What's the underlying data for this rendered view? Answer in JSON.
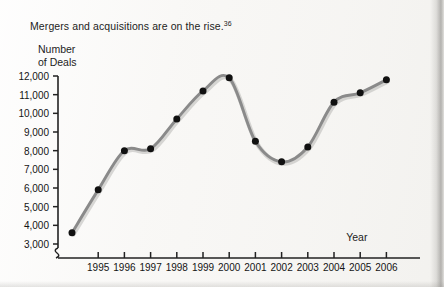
{
  "caption": {
    "text": "Mergers and acquisitions are on the rise.",
    "footnote_marker": "36"
  },
  "axis_titles": {
    "y": "Number\nof Deals",
    "x": "Year"
  },
  "colors": {
    "line": "#8a8a8a",
    "marker": "#111111",
    "axis": "#222222",
    "text": "#1a1a1a",
    "paper": "#f7f6f4"
  },
  "chart_data": {
    "type": "line",
    "title": "Mergers and acquisitions are on the rise.",
    "xlabel": "Year",
    "ylabel": "Number of Deals",
    "ylim": [
      3000,
      12000
    ],
    "y_tick_labels": [
      "12,000",
      "11,000",
      "10,000",
      "9,000",
      "8,000",
      "7,000",
      "6,000",
      "5,000",
      "4,000",
      "3,000"
    ],
    "y_ticks": [
      12000,
      11000,
      10000,
      9000,
      8000,
      7000,
      6000,
      5000,
      4000,
      3000
    ],
    "y_axis_break": true,
    "x_tick_labels": [
      "1995",
      "1996",
      "1997",
      "1998",
      "1999",
      "2000",
      "2001",
      "2002",
      "2003",
      "2004",
      "2005",
      "2006"
    ],
    "x_ticks": [
      1995,
      1996,
      1997,
      1998,
      1999,
      2000,
      2001,
      2002,
      2003,
      2004,
      2005,
      2006
    ],
    "xlim": [
      1994,
      2006
    ],
    "grid": false,
    "legend": "none",
    "smoothed": true,
    "x": [
      1994,
      1995,
      1996,
      1997,
      1998,
      1999,
      2000,
      2001,
      2002,
      2003,
      2004,
      2005,
      2006
    ],
    "values": [
      3600,
      5900,
      8000,
      8100,
      9700,
      11200,
      11900,
      8500,
      7400,
      8200,
      10600,
      11100,
      11800
    ],
    "series": [
      {
        "name": "Number of Deals",
        "points": [
          {
            "year": 1994,
            "deals": 3600
          },
          {
            "year": 1995,
            "deals": 5900
          },
          {
            "year": 1996,
            "deals": 8000
          },
          {
            "year": 1997,
            "deals": 8100
          },
          {
            "year": 1998,
            "deals": 9700
          },
          {
            "year": 1999,
            "deals": 11200
          },
          {
            "year": 2000,
            "deals": 11900
          },
          {
            "year": 2001,
            "deals": 8500
          },
          {
            "year": 2002,
            "deals": 7400
          },
          {
            "year": 2003,
            "deals": 8200
          },
          {
            "year": 2004,
            "deals": 10600
          },
          {
            "year": 2005,
            "deals": 11100
          },
          {
            "year": 2006,
            "deals": 11800
          }
        ]
      }
    ]
  }
}
